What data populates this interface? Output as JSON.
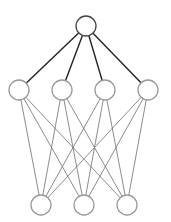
{
  "diagram": {
    "type": "neural-network",
    "caption_cutoff": "",
    "layers": [
      {
        "name": "output",
        "nodes": 1
      },
      {
        "name": "hidden",
        "nodes": 4
      },
      {
        "name": "input",
        "nodes": 3
      }
    ],
    "connections": [
      {
        "from_layer": "hidden",
        "to_layer": "output",
        "style": "dark"
      },
      {
        "from_layer": "input",
        "to_layer": "hidden",
        "style": "light"
      }
    ],
    "colors": {
      "node_stroke": "#9a9a9a",
      "node_fill": "#ffffff",
      "output_node_stroke": "#444444",
      "dark_edge": "#222222",
      "light_edge": "#6e6e6e"
    }
  }
}
